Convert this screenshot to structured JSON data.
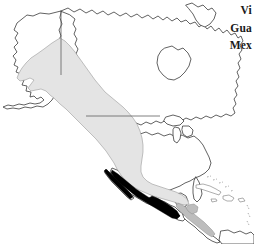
{
  "figure": {
    "kind": "distribution-map",
    "region": "North America",
    "background_color": "#ffffff",
    "width": 254,
    "height": 244
  },
  "map": {
    "outline_color": "#3a3a3a",
    "outline_width": "0.8",
    "border_line_color": "#555555",
    "land_fill": "#ffffff",
    "features": [
      {
        "name": "alaska",
        "label": "Alaska"
      },
      {
        "name": "canada-mainland",
        "label": "Canada"
      },
      {
        "name": "hudson-bay",
        "label": "Hudson Bay"
      },
      {
        "name": "greenland-edge",
        "label": "Greenland"
      },
      {
        "name": "united-states",
        "label": "United States"
      },
      {
        "name": "great-lakes",
        "label": "Great Lakes"
      },
      {
        "name": "mexico",
        "label": "Mexico"
      },
      {
        "name": "baja-california",
        "label": "Baja California"
      },
      {
        "name": "central-america",
        "label": "Central America"
      },
      {
        "name": "caribbean-islands",
        "label": "Caribbean Islands"
      },
      {
        "name": "south-america-edge",
        "label": "South America"
      }
    ],
    "internal_borders": [
      {
        "name": "alaska-yukon-border",
        "label": "141st meridian"
      },
      {
        "name": "us-canada-border",
        "label": "49th parallel"
      }
    ]
  },
  "range_shading": {
    "breeding_or_core": {
      "name": "core-range",
      "fill": "#000000",
      "description": "Solid black core range over western and central Mexico"
    },
    "broad_range": {
      "name": "broad-range",
      "fill": "#e4e4e4",
      "stroke": "#9a9a9a",
      "description": "Light gray range band from Alaska south through western Canada, western United States and into Mexico"
    },
    "southern_extension": {
      "name": "southern-range-extension",
      "fill": "#bdbdbd",
      "stroke": "#8d8d8d",
      "description": "Medium gray extension through Central America"
    }
  },
  "labels": {
    "truncated": true,
    "items": [
      {
        "name": "label-vi",
        "text": "Vi"
      },
      {
        "name": "label-gua",
        "text": "Gua"
      },
      {
        "name": "label-mex",
        "text": "Mex"
      }
    ]
  }
}
